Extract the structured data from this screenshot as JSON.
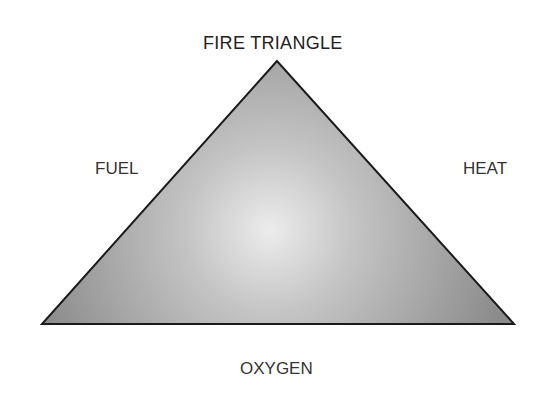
{
  "diagram": {
    "title": "FIRE TRIANGLE",
    "labels": {
      "left": "FUEL",
      "right": "HEAT",
      "bottom": "OXYGEN"
    },
    "colors": {
      "fill_center": "#ececec",
      "fill_edge": "#8f8f8f",
      "stroke": "#1a1a1a",
      "text": "#333333"
    }
  }
}
